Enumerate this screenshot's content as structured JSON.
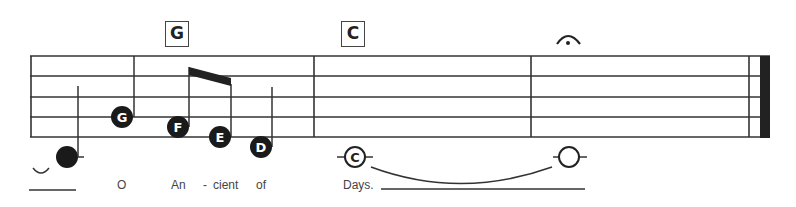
{
  "chords": [
    {
      "label": "G",
      "x": 165
    },
    {
      "label": "C",
      "x": 341
    }
  ],
  "notes": [
    {
      "letter": "G"
    },
    {
      "letter": "F"
    },
    {
      "letter": "E"
    },
    {
      "letter": "D"
    },
    {
      "letter": "C"
    }
  ],
  "lyrics": [
    {
      "text": "O",
      "x": 117
    },
    {
      "text": "An",
      "x": 171
    },
    {
      "text": "-",
      "x": 203
    },
    {
      "text": "cient",
      "x": 213
    },
    {
      "text": "of",
      "x": 256
    },
    {
      "text": "Days.",
      "x": 343
    }
  ],
  "colors": {
    "ink": "#222222",
    "note_fill": "#1a1a1a"
  }
}
